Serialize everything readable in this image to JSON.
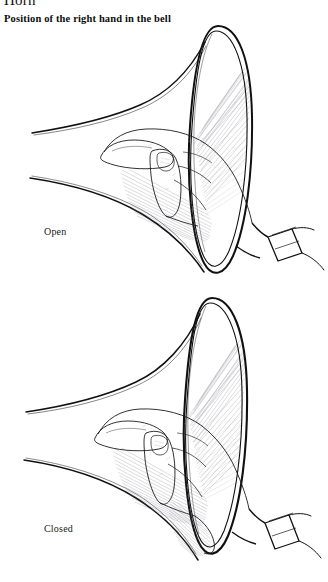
{
  "page": {
    "instrument_heading": "Horn",
    "section_subtitle": "Position of the right hand in the bell"
  },
  "figures": [
    {
      "id": "open",
      "caption": "Open",
      "description": "Right hand held loosely inside the horn bell, fingers together, palm angled toward the far side of the bell, leaving the bell mostly unobstructed",
      "icon": "horn-bell-hand-open-illustration"
    },
    {
      "id": "closed",
      "caption": "Closed",
      "description": "Right hand pressed further into the horn bell, the palm and fingers sealing the throat of the bell",
      "icon": "horn-bell-hand-closed-illustration"
    }
  ],
  "colors": {
    "background": "#ffffff",
    "ink": "#111111",
    "hatching": "#7a7a86"
  }
}
